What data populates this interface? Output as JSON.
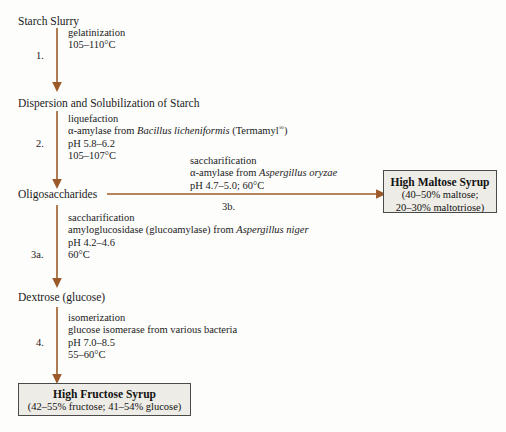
{
  "diagram": {
    "accent_color": "#9c5a2a",
    "box_fill": "#eeece6",
    "box_border": "#4a4a4a",
    "background": "#fdfdfb"
  },
  "nodes": {
    "start": "Starch Slurry",
    "dispersion": "Dispersion and Solubilization of Starch",
    "oligosaccharides": "Oligosaccharides",
    "dextrose": "Dextrose (glucose)"
  },
  "steps": {
    "one": {
      "label": "1.",
      "lines": [
        "gelatinization",
        "105–110°C"
      ]
    },
    "two": {
      "label": "2.",
      "line1": "liquefaction",
      "line2_pre": "α-amylase from ",
      "line2_italic": "Bacillus licheniformis",
      "line2_post": " (Termamyl",
      "line2_sup": "®",
      "line2_end": ")",
      "line3": "pH 5.8–6.2",
      "line4": "105–107°C"
    },
    "three_a": {
      "label": "3a.",
      "line1": "saccharification",
      "line2_pre": "amyloglucosidase (glucoamylase) from ",
      "line2_italic": "Aspergillus niger",
      "line3": "pH 4.2–4.6",
      "line4": "60°C"
    },
    "three_b": {
      "label": "3b.",
      "line1": "saccharification",
      "line2_pre": "α-amylase from ",
      "line2_italic": "Aspergillus oryzae",
      "line3": "pH 4.7–5.0; 60°C"
    },
    "four": {
      "label": "4.",
      "line1": "isomerization",
      "line2": "glucose isomerase from various bacteria",
      "line3": "pH 7.0–8.5",
      "line4": "55–60°C"
    }
  },
  "products": {
    "maltose": {
      "title": "High Maltose Syrup",
      "detail_line1": "(40–50% maltose;",
      "detail_line2": "20–30% maltotriose)"
    },
    "fructose": {
      "title": "High Fructose Syrup",
      "detail_line1": "(42–55% fructose; 41–54% glucose)"
    }
  }
}
